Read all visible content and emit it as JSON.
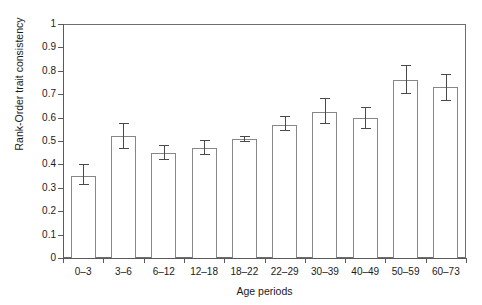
{
  "chart_data": {
    "type": "bar",
    "title": "",
    "xlabel": "Age periods",
    "ylabel": "Rank-Order trait consistency",
    "categories": [
      "0–3",
      "3–6",
      "6–12",
      "12–18",
      "18–22",
      "22–29",
      "30–39",
      "40–49",
      "50–59",
      "60–73"
    ],
    "values": [
      0.35,
      0.52,
      0.45,
      0.47,
      0.51,
      0.57,
      0.625,
      0.6,
      0.76,
      0.73
    ],
    "error_upper": [
      0.4,
      0.575,
      0.485,
      0.505,
      0.52,
      0.605,
      0.685,
      0.645,
      0.825,
      0.785
    ],
    "error_lower": [
      0.315,
      0.468,
      0.425,
      0.445,
      0.502,
      0.545,
      0.575,
      0.555,
      0.705,
      0.675
    ],
    "ylim": [
      0,
      1
    ],
    "yticks": [
      0,
      0.1,
      0.2,
      0.3,
      0.4,
      0.5,
      0.6,
      0.7,
      0.8,
      0.9,
      1
    ],
    "ytick_labels": [
      "0",
      "0.1",
      "0.2",
      "0.3",
      "0.4",
      "0.5",
      "0.6",
      "0.7",
      "0.8",
      "0.9",
      "1"
    ],
    "grid": false,
    "legend": null,
    "bar_facecolor": "#ffffff",
    "bar_edgecolor": "#878787",
    "error_color": "#4a4a4a",
    "axis_color": "#5a5a5a"
  }
}
